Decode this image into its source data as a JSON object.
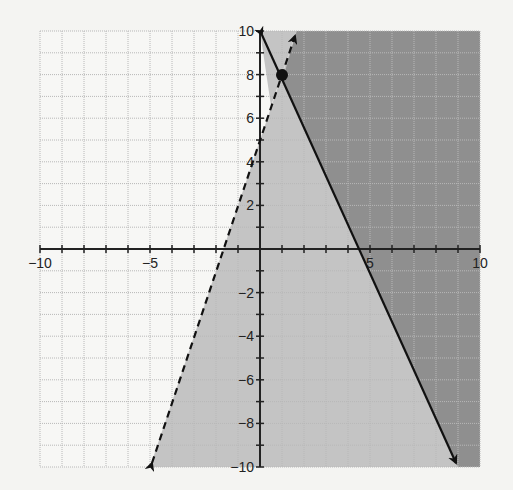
{
  "chart_data": {
    "type": "line",
    "title": "",
    "xlabel": "",
    "ylabel": "",
    "xlim": [
      -10,
      10
    ],
    "ylim": [
      -10,
      10
    ],
    "grid": true,
    "grid_step": 1,
    "x_tick_labels": [
      {
        "value": -10,
        "label": "−10"
      },
      {
        "value": -5,
        "label": "−5"
      },
      {
        "value": 5,
        "label": "5"
      },
      {
        "value": 10,
        "label": "10"
      }
    ],
    "y_tick_labels": [
      {
        "value": 10,
        "label": "10"
      },
      {
        "value": 8,
        "label": "8"
      },
      {
        "value": 6,
        "label": "6"
      },
      {
        "value": 4,
        "label": "4"
      },
      {
        "value": 2,
        "label": "2"
      },
      {
        "value": -2,
        "label": "−2"
      },
      {
        "value": -4,
        "label": "−4"
      },
      {
        "value": -6,
        "label": "−6"
      },
      {
        "value": -8,
        "label": "−8"
      },
      {
        "value": -10,
        "label": "−10"
      }
    ],
    "series": [
      {
        "name": "solid boundary line",
        "style": "solid",
        "equation": "y = 10 - (20/9)x",
        "points": [
          [
            0,
            10
          ],
          [
            4.5,
            0
          ],
          [
            9,
            -10
          ]
        ],
        "arrows": "both"
      },
      {
        "name": "dashed boundary line",
        "style": "dashed",
        "equation": "y = 3x + 5",
        "points": [
          [
            -5,
            -10
          ],
          [
            -1.67,
            0
          ],
          [
            1.67,
            10
          ]
        ],
        "arrows": "both"
      }
    ],
    "points": [
      {
        "x": 1,
        "y": 8,
        "label": ""
      }
    ],
    "regions": [
      {
        "name": "light shaded",
        "description": "right of dashed line or right of solid line",
        "color": "#c2c2c2"
      },
      {
        "name": "dark shaded",
        "description": "overlap: right of dashed line and right of solid line",
        "color": "#8e8e8e"
      }
    ]
  },
  "colors": {
    "background": "#f4f4f2",
    "grid": "#bdbdbd",
    "axis": "#222222",
    "light_region": "#c4c4c4",
    "dark_region": "#8f8f8f",
    "lines": "#111111"
  }
}
